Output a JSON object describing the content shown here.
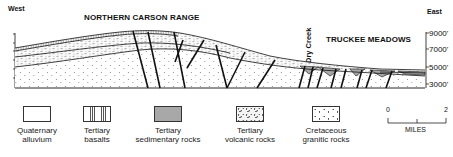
{
  "figure": {
    "direction_left": "West",
    "direction_right": "East",
    "region_labels": [
      "NORTHERN CARSON RANGE",
      "TRUCKEE MEADOWS"
    ],
    "feature_label": "Dry Creek",
    "elevation_ticks": [
      "9000'",
      "7000'",
      "5000'",
      "3000'"
    ],
    "colors": {
      "line": "#111111",
      "sedimentary_fill": "#a8a8a8",
      "background": "#ffffff"
    }
  },
  "legend": {
    "items": [
      {
        "label_line1": "Quaternary",
        "label_line2": "alluvium",
        "pattern": "blank"
      },
      {
        "label_line1": "Tertiary",
        "label_line2": "basalts",
        "pattern": "vertical-lines"
      },
      {
        "label_line1": "Tertiary",
        "label_line2": "sedimentary rocks",
        "pattern": "gray-fill"
      },
      {
        "label_line1": "Tertiary",
        "label_line2": "volcanic rocks",
        "pattern": "dense-dashes"
      },
      {
        "label_line1": "Cretaceous",
        "label_line2": "granitic rocks",
        "pattern": "sparse-dots"
      }
    ],
    "scale": {
      "start": "0",
      "end": "2",
      "unit": "MILES"
    }
  }
}
